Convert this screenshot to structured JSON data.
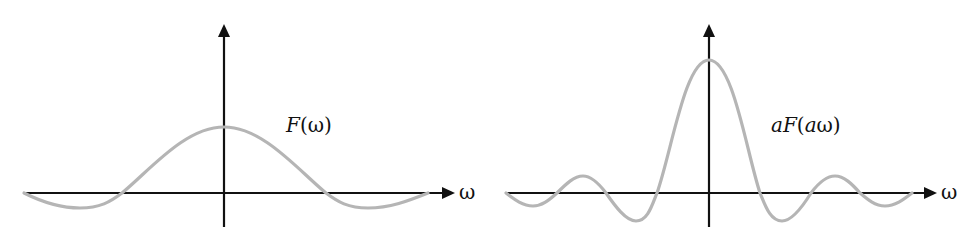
{
  "panels": [
    {
      "id": "left",
      "function_label": "F(ω)",
      "function_parts": [
        {
          "text": "F",
          "italic": true
        },
        {
          "text": "(ω)",
          "italic": false
        }
      ],
      "x_axis_label": "ω",
      "curve_color": "#b5b5b5",
      "axis_color": "#111111"
    },
    {
      "id": "right",
      "function_label": "aF(aω)",
      "function_parts": [
        {
          "text": "aF",
          "italic": true
        },
        {
          "text": "(",
          "italic": false
        },
        {
          "text": "a",
          "italic": true
        },
        {
          "text": "ω)",
          "italic": false
        }
      ],
      "x_axis_label": "ω",
      "curve_color": "#b5b5b5",
      "axis_color": "#111111"
    }
  ]
}
